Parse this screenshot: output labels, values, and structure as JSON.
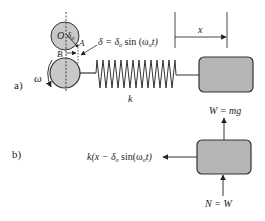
{
  "part_a": {
    "label": "a)",
    "center_label": "O",
    "offset_label": "δ",
    "offset_sub": "o",
    "point_a": "A",
    "point_b": "B",
    "omega": "ω",
    "displacement_eq": {
      "lhs": "δ = δ",
      "lhs_sub": "o",
      "func": " sin (ω",
      "func_sub": "o",
      "tail": "t)"
    },
    "x_label": "x",
    "spring_label": "k"
  },
  "part_b": {
    "label": "b)",
    "weight_label": "W = mg",
    "normal_label": "N = W",
    "spring_force": {
      "pre": "k(x − δ",
      "sub1": "o",
      "mid": " sin(ω",
      "sub2": "o",
      "tail": "t)"
    }
  },
  "colors": {
    "fill_gray": "#c8c8c8",
    "box_gray": "#b5b5b5",
    "stroke": "#333333"
  }
}
